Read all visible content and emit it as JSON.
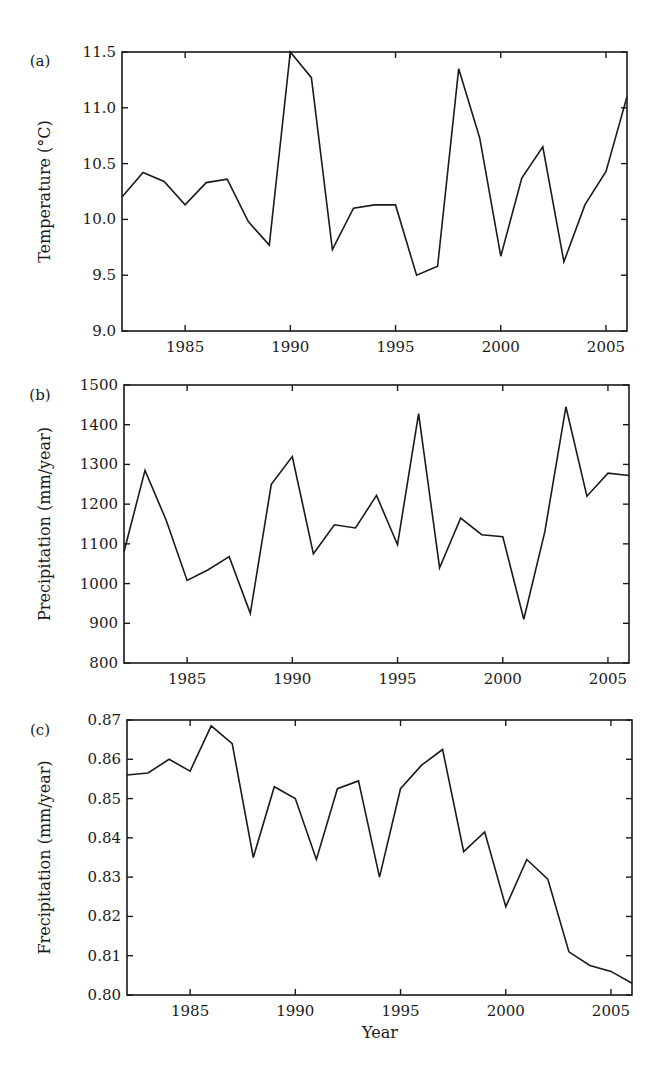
{
  "figure": {
    "xlabel": "Year"
  },
  "chart_data": [
    {
      "type": "line",
      "panel": "(a)",
      "title": "",
      "xlabel": "",
      "ylabel": "Temperature (°C)",
      "xlim": [
        1982,
        2006
      ],
      "ylim": [
        9.0,
        11.5
      ],
      "xticks": [
        1985,
        1990,
        1995,
        2000,
        2005
      ],
      "yticks": [
        "9.0",
        "9.5",
        "10.0",
        "10.5",
        "11.0",
        "11.5"
      ],
      "grid": false,
      "x": [
        1982,
        1983,
        1984,
        1985,
        1986,
        1987,
        1988,
        1989,
        1990,
        1991,
        1992,
        1993,
        1994,
        1995,
        1996,
        1997,
        1998,
        1999,
        2000,
        2001,
        2002,
        2003,
        2004,
        2005,
        2006
      ],
      "values": [
        10.2,
        10.42,
        10.34,
        10.13,
        10.33,
        10.36,
        9.98,
        9.77,
        11.5,
        11.27,
        9.73,
        10.1,
        10.13,
        10.13,
        9.5,
        9.58,
        11.35,
        10.73,
        9.67,
        10.37,
        10.65,
        9.62,
        10.13,
        10.43,
        11.1
      ]
    },
    {
      "type": "line",
      "panel": "(b)",
      "title": "",
      "xlabel": "",
      "ylabel": "Precipitation (mm/year)",
      "xlim": [
        1982,
        2006
      ],
      "ylim": [
        800,
        1500
      ],
      "xticks": [
        1985,
        1990,
        1995,
        2000,
        2005
      ],
      "yticks": [
        "800",
        "900",
        "1000",
        "1100",
        "1200",
        "1300",
        "1400",
        "1500"
      ],
      "grid": false,
      "x": [
        1982,
        1983,
        1984,
        1985,
        1986,
        1987,
        1988,
        1989,
        1990,
        1991,
        1992,
        1993,
        1994,
        1995,
        1996,
        1997,
        1998,
        1999,
        2000,
        2001,
        2002,
        2003,
        2004,
        2005,
        2006
      ],
      "values": [
        1080,
        1285,
        1160,
        1008,
        1035,
        1068,
        925,
        1250,
        1320,
        1075,
        1148,
        1140,
        1222,
        1098,
        1428,
        1040,
        1165,
        1123,
        1118,
        910,
        1130,
        1445,
        1220,
        1278,
        1272
      ]
    },
    {
      "type": "line",
      "panel": "(c)",
      "title": "",
      "xlabel": "Year",
      "ylabel": "Frecipitation (mm/year)",
      "xlim": [
        1982,
        2006
      ],
      "ylim": [
        0.8,
        0.87
      ],
      "xticks": [
        1985,
        1990,
        1995,
        2000,
        2005
      ],
      "yticks": [
        "0.80",
        "0.81",
        "0.82",
        "0.83",
        "0.84",
        "0.85",
        "0.86",
        "0.87"
      ],
      "grid": false,
      "x": [
        1982,
        1983,
        1984,
        1985,
        1986,
        1987,
        1988,
        1989,
        1990,
        1991,
        1992,
        1993,
        1994,
        1995,
        1996,
        1997,
        1998,
        1999,
        2000,
        2001,
        2002,
        2003,
        2004,
        2005,
        2006
      ],
      "values": [
        0.856,
        0.8565,
        0.86,
        0.857,
        0.8685,
        0.864,
        0.835,
        0.853,
        0.85,
        0.8345,
        0.8525,
        0.8545,
        0.83,
        0.8525,
        0.8585,
        0.8625,
        0.8365,
        0.8415,
        0.8225,
        0.8345,
        0.8295,
        0.811,
        0.8075,
        0.806,
        0.803
      ]
    }
  ]
}
